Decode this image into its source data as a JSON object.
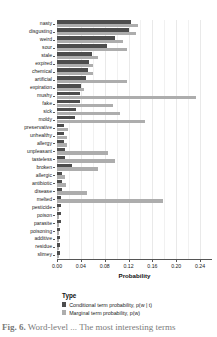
{
  "chart_data": {
    "type": "bar",
    "orientation": "horizontal",
    "title": "",
    "xlabel": "Probability",
    "ylabel": "",
    "xlim": [
      0.0,
      0.26
    ],
    "xticks": [
      "0.00",
      "0.04",
      "0.08",
      "0.12",
      "0.16",
      "0.20",
      "0.24"
    ],
    "xtick_values": [
      0.0,
      0.04,
      0.08,
      0.12,
      0.16,
      0.2,
      0.24
    ],
    "grid": "vertical",
    "legend_position": "below",
    "legend_title": "Type",
    "categories": [
      "nasty",
      "disgusting",
      "weird",
      "sour",
      "stale",
      "expired",
      "chemical",
      "artificial",
      "expiration",
      "mushy",
      "fake",
      "sick",
      "moldy",
      "preservative",
      "unhealthy",
      "allergy",
      "unpleasant",
      "tasteless",
      "broken",
      "allergic",
      "antibiotic",
      "disease",
      "melted",
      "pesticide",
      "poison",
      "parasite",
      "poisoning",
      "additive",
      "residue",
      "slimey"
    ],
    "series": [
      {
        "name": "Conditional term probability, p(w | t)",
        "color": "#4d4d4d",
        "values": [
          0.124,
          0.121,
          0.097,
          0.084,
          0.058,
          0.053,
          0.052,
          0.049,
          0.04,
          0.039,
          0.038,
          0.032,
          0.031,
          0.012,
          0.011,
          0.011,
          0.014,
          0.013,
          0.025,
          0.009,
          0.008,
          0.008,
          0.007,
          0.006,
          0.006,
          0.006,
          0.005,
          0.005,
          0.005,
          0.005
        ]
      },
      {
        "name": "Marginal term probability, p(w)",
        "color": "#adadad",
        "values": [
          0.136,
          0.133,
          0.11,
          0.118,
          0.069,
          0.06,
          0.06,
          0.118,
          0.046,
          0.233,
          0.094,
          0.105,
          0.148,
          0.018,
          0.017,
          0.017,
          0.086,
          0.097,
          0.068,
          0.013,
          0.015,
          0.05,
          0.177,
          0.004,
          0.004,
          0.004,
          0.004,
          0.004,
          0.004,
          0.004
        ]
      }
    ]
  },
  "axis": {
    "x_title": "Probability"
  },
  "legend": {
    "title": "Type",
    "items": [
      {
        "label": "Conditional term probability, p(w | t)",
        "color": "#4d4d4d"
      },
      {
        "label": "Marginal term probability, p(w)",
        "color": "#adadad"
      }
    ]
  },
  "caption": {
    "prefix": "Fig. 6.",
    "text": " Word-level ... The most interesting terms"
  }
}
